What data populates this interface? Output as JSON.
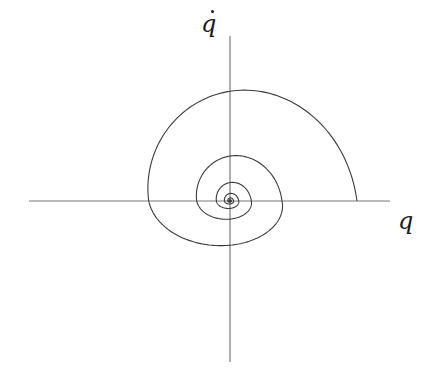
{
  "diagram": {
    "type": "phase-portrait",
    "x_axis_label": "q",
    "y_axis_label": "q",
    "y_axis_label_has_dot": true,
    "colors": {
      "axis": "#7a7a7a",
      "curve": "#3a3a3a",
      "label": "#1a1a1a",
      "background": "#ffffff"
    },
    "origin": {
      "x": 230,
      "y": 201
    },
    "x_axis": {
      "x1": 29,
      "x2": 390,
      "y": 201
    },
    "y_axis": {
      "x": 230,
      "y1": 36,
      "y2": 362
    },
    "spiral": {
      "start_radius": 127,
      "start_angle_deg": 0,
      "direction": "counter-clockwise",
      "decay_per_half_turn": 0.64,
      "vertical_scale": 1.08,
      "turns": 7,
      "crossings": [
        {
          "side": "right",
          "x": 357
        },
        {
          "side": "top",
          "y": 62
        },
        {
          "side": "left",
          "x": 148
        },
        {
          "side": "bottom",
          "y": 287
        },
        {
          "side": "right",
          "x": 281
        },
        {
          "side": "top",
          "y": 146
        },
        {
          "side": "left",
          "x": 198
        },
        {
          "side": "bottom",
          "y": 236
        },
        {
          "side": "right",
          "x": 247
        }
      ]
    }
  }
}
